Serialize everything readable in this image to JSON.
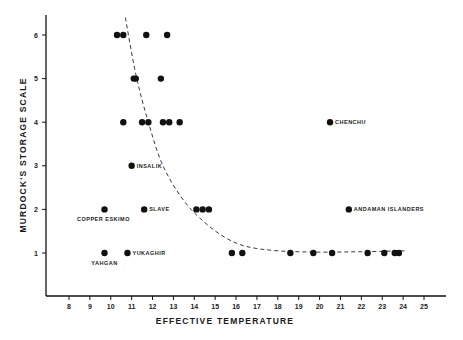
{
  "chart_data": {
    "type": "scatter",
    "title": "",
    "xlabel": "EFFECTIVE TEMPERATURE",
    "ylabel": "MURDOCK'S STORAGE SCALE",
    "xlim": [
      7,
      26
    ],
    "ylim": [
      0,
      6.5
    ],
    "xticks": [
      8,
      9,
      10,
      11,
      12,
      13,
      14,
      15,
      16,
      17,
      18,
      19,
      20,
      21,
      22,
      23,
      24,
      25
    ],
    "yticks": [
      1,
      2,
      3,
      4,
      5,
      6
    ],
    "grid": false,
    "legend": "none",
    "points": [
      {
        "x": 10.3,
        "y": 6
      },
      {
        "x": 10.6,
        "y": 6
      },
      {
        "x": 11.7,
        "y": 6
      },
      {
        "x": 12.7,
        "y": 6
      },
      {
        "x": 11.1,
        "y": 5
      },
      {
        "x": 11.2,
        "y": 5
      },
      {
        "x": 12.4,
        "y": 5
      },
      {
        "x": 10.6,
        "y": 4
      },
      {
        "x": 11.5,
        "y": 4
      },
      {
        "x": 11.8,
        "y": 4
      },
      {
        "x": 12.5,
        "y": 4
      },
      {
        "x": 12.8,
        "y": 4
      },
      {
        "x": 13.3,
        "y": 4
      },
      {
        "x": 20.5,
        "y": 4,
        "label": "CHENCHU"
      },
      {
        "x": 11.0,
        "y": 3,
        "label": "INSALIK"
      },
      {
        "x": 9.7,
        "y": 2,
        "label": "COPPER ESKIMO"
      },
      {
        "x": 11.6,
        "y": 2,
        "label": "SLAVE"
      },
      {
        "x": 14.1,
        "y": 2
      },
      {
        "x": 14.4,
        "y": 2
      },
      {
        "x": 14.7,
        "y": 2
      },
      {
        "x": 21.4,
        "y": 2,
        "label": "ANDAMAN ISLANDERS"
      },
      {
        "x": 9.7,
        "y": 1,
        "label": "YAHGAN"
      },
      {
        "x": 10.8,
        "y": 1,
        "label": "YUKAGHIR"
      },
      {
        "x": 15.8,
        "y": 1
      },
      {
        "x": 16.3,
        "y": 1
      },
      {
        "x": 18.6,
        "y": 1
      },
      {
        "x": 19.7,
        "y": 1
      },
      {
        "x": 20.6,
        "y": 1
      },
      {
        "x": 22.3,
        "y": 1
      },
      {
        "x": 23.1,
        "y": 1
      },
      {
        "x": 23.6,
        "y": 1
      },
      {
        "x": 23.8,
        "y": 1
      }
    ],
    "trend_curve": {
      "style": "dashed",
      "points": [
        [
          10.7,
          6.4
        ],
        [
          11.2,
          5.1
        ],
        [
          11.8,
          4.0
        ],
        [
          12.5,
          3.0
        ],
        [
          13.5,
          2.2
        ],
        [
          14.5,
          1.7
        ],
        [
          15.5,
          1.35
        ],
        [
          16.5,
          1.15
        ],
        [
          18,
          1.05
        ],
        [
          20,
          1.02
        ],
        [
          22,
          1.03
        ],
        [
          24.2,
          1.05
        ]
      ]
    },
    "annotations": [
      "CHENCHU",
      "INSALIK",
      "COPPER ESKIMO",
      "SLAVE",
      "ANDAMAN ISLANDERS",
      "YAHGAN",
      "YUKAGHIR"
    ]
  }
}
